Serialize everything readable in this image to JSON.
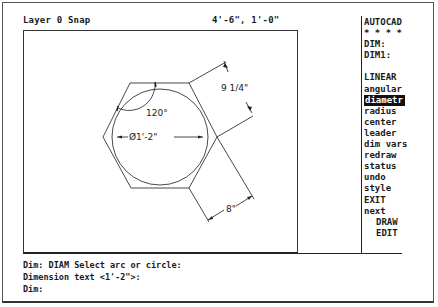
{
  "status_bar": {
    "layer_snap": "Layer 0 Snap",
    "coordinates": "4'-6\", 1'-0\""
  },
  "drawing": {
    "angle_label": "120°",
    "diameter_label": "Ø1'-2\"",
    "side_label": "9 1/4\"",
    "bottom_label": "8\""
  },
  "screen_menu": {
    "items": [
      {
        "label": "AUTOCAD",
        "type": "header"
      },
      {
        "label": "* * * *",
        "type": "header"
      },
      {
        "label": "DIM:",
        "type": "item"
      },
      {
        "label": "DIM1:",
        "type": "item"
      },
      {
        "label": "",
        "type": "spacer"
      },
      {
        "label": "LINEAR",
        "type": "item"
      },
      {
        "label": "angular",
        "type": "item"
      },
      {
        "label": "diametr",
        "type": "item",
        "selected": true
      },
      {
        "label": "radius",
        "type": "item"
      },
      {
        "label": "center",
        "type": "item"
      },
      {
        "label": "leader",
        "type": "item"
      },
      {
        "label": "dim vars",
        "type": "item"
      },
      {
        "label": "redraw",
        "type": "item"
      },
      {
        "label": "status",
        "type": "item"
      },
      {
        "label": "undo",
        "type": "item"
      },
      {
        "label": "style",
        "type": "item"
      },
      {
        "label": "EXIT",
        "type": "item"
      },
      {
        "label": "next",
        "type": "item"
      },
      {
        "label": "DRAW",
        "type": "sub"
      },
      {
        "label": "EDIT",
        "type": "sub"
      }
    ]
  },
  "command_line": {
    "lines": [
      "Dim: DIAM Select arc or circle:",
      "Dimension text <1'-2\">:",
      "Dim:"
    ]
  },
  "colors": {
    "background": "#ffffff",
    "foreground": "#1a1a1a",
    "highlight_bg": "#111111",
    "highlight_fg": "#ffffff"
  }
}
